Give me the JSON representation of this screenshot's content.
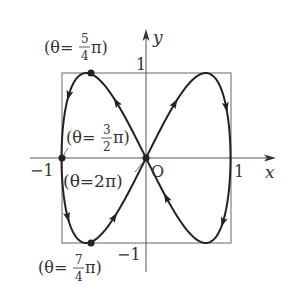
{
  "figure": {
    "curve": {
      "x_expr": "sin θ",
      "y_expr": "sin 2θ",
      "range": [
        0,
        6.2832
      ]
    },
    "axes": {
      "x_label": "x",
      "y_label": "y",
      "origin_label": "O"
    },
    "ticks": {
      "x_pos": "1",
      "x_neg": "−1",
      "y_pos": "1",
      "y_neg": "−1"
    },
    "annotations": [
      {
        "id": "theta-5-4",
        "prefix": "(θ=",
        "num": "5",
        "den": "4",
        "suffix": "π)"
      },
      {
        "id": "theta-3-2",
        "prefix": "(θ=",
        "num": "3",
        "den": "2",
        "suffix": "π)"
      },
      {
        "id": "theta-2pi",
        "text": "(θ=2π)"
      },
      {
        "id": "theta-7-4",
        "prefix": "(θ=",
        "num": "7",
        "den": "4",
        "suffix": "π)"
      }
    ],
    "colors": {
      "curve": "#222222",
      "axes": "#555555",
      "text": "#333333"
    }
  }
}
